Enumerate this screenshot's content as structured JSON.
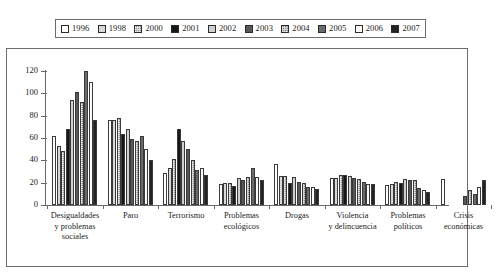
{
  "chart_data": {
    "type": "bar",
    "title": "",
    "subtitle": "",
    "xlabel": "",
    "ylabel": "",
    "ylim": [
      0,
      120
    ],
    "yticks": [
      0,
      20,
      40,
      60,
      80,
      100,
      120
    ],
    "grid": false,
    "legend_position": "top",
    "categories": [
      "Desigualdades y problemas sociales",
      "Paro",
      "Terrorismo",
      "Problemas ecológicos",
      "Drogas",
      "Violencia y delincuencia",
      "Problemas políticos",
      "Crisis económicas"
    ],
    "category_lines": [
      [
        "Desigualdades",
        "y  problemas",
        "sociales"
      ],
      [
        "Paro"
      ],
      [
        "Terrorismo"
      ],
      [
        "Problemas",
        "ecológicos"
      ],
      [
        "Drogas"
      ],
      [
        "Violencia",
        "y delincuencia"
      ],
      [
        "Problemas",
        "políticos"
      ],
      [
        "Crisis",
        "económicas"
      ]
    ],
    "series": [
      {
        "name": "1996",
        "pattern": "p-white",
        "values": [
          62,
          76,
          29,
          19,
          37,
          24,
          18,
          23
        ]
      },
      {
        "name": "1998",
        "pattern": "p-lgray",
        "values": [
          53,
          76,
          33,
          20,
          26,
          24,
          19,
          null
        ]
      },
      {
        "name": "2000",
        "pattern": "p-mgrid",
        "values": [
          48,
          78,
          41,
          20,
          26,
          27,
          21,
          null
        ]
      },
      {
        "name": "2001",
        "pattern": "p-black",
        "values": [
          68,
          64,
          68,
          17,
          20,
          27,
          20,
          null
        ]
      },
      {
        "name": "2002",
        "pattern": "p-lgray2",
        "values": [
          94,
          68,
          57,
          24,
          25,
          26,
          23,
          null
        ]
      },
      {
        "name": "2003",
        "pattern": "p-dgray",
        "values": [
          101,
          59,
          50,
          22,
          21,
          24,
          22,
          8
        ]
      },
      {
        "name": "2004",
        "pattern": "p-mgrid2",
        "values": [
          92,
          57,
          40,
          25,
          20,
          23,
          22,
          13
        ]
      },
      {
        "name": "2005",
        "pattern": "p-dgray2",
        "values": [
          120,
          62,
          31,
          33,
          16,
          21,
          15,
          10
        ]
      },
      {
        "name": "2006",
        "pattern": "p-white2",
        "values": [
          110,
          50,
          33,
          25,
          16,
          19,
          13,
          16
        ]
      },
      {
        "name": "2007",
        "pattern": "p-black2",
        "values": [
          76,
          40,
          27,
          22,
          14,
          19,
          12,
          22
        ]
      }
    ]
  }
}
